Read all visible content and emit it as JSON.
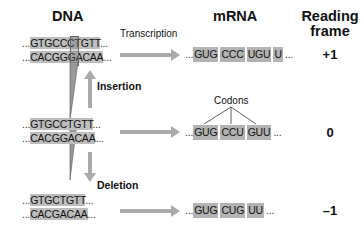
{
  "headers": {
    "dna": "DNA",
    "mrna": "mRNA",
    "reading_frame_line1": "Reading",
    "reading_frame_line2": "frame"
  },
  "labels": {
    "transcription": "Transcription",
    "insertion": "Insertion",
    "deletion": "Deletion",
    "codons": "Codons"
  },
  "rows": [
    {
      "name": "insertion",
      "dna_top_prefix": "...",
      "dna_top": "GTGCCCTGTT",
      "dna_top_suffix": "...",
      "dna_bottom_prefix": "...",
      "dna_bottom": "CACGGGACAA",
      "dna_bottom_suffix": "...",
      "mrna_prefix": "...",
      "codons": [
        "GUG",
        "CCC",
        "UGU",
        "U"
      ],
      "mrna_suffix": "...",
      "frame": "+1"
    },
    {
      "name": "original",
      "dna_top_prefix": "...",
      "dna_top": "GTGCCTGTT",
      "dna_top_suffix": "...",
      "dna_bottom_prefix": "...",
      "dna_bottom": "CACGGACAA",
      "dna_bottom_suffix": "...",
      "mrna_prefix": "...",
      "codons": [
        "GUG",
        "CCU",
        "GUU"
      ],
      "mrna_suffix": "...",
      "frame": "0"
    },
    {
      "name": "deletion",
      "dna_top_prefix": "...",
      "dna_top": "GTGCTGTT",
      "dna_top_suffix": "...",
      "dna_bottom_prefix": "...",
      "dna_bottom": "CACGACAA",
      "dna_bottom_suffix": "...",
      "mrna_prefix": "...",
      "codons": [
        "GUG",
        "CUG",
        "UU"
      ],
      "mrna_suffix": "...",
      "frame": "–1"
    }
  ],
  "colors": {
    "box": "#bdbdbd",
    "arrow": "#aaaaaa",
    "highlight": "#6e6e6e"
  }
}
